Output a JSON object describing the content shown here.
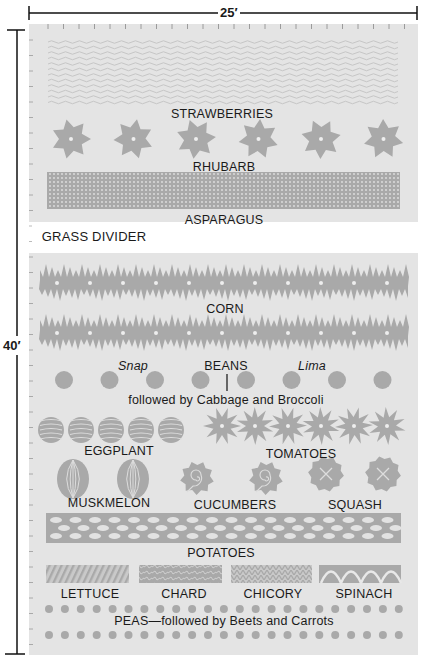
{
  "dimensions": {
    "width_label": "25′",
    "length_label": "40′"
  },
  "colors": {
    "bed": "#e4e4e4",
    "plant": "#a9a9a9",
    "pattern_light": "#c9c9c9",
    "text": "#1a1a1a"
  },
  "beds": [
    {
      "name": "upper-bed",
      "rows": [
        "strawberries",
        "rhubarb",
        "asparagus"
      ]
    },
    {
      "name": "lower-bed",
      "rows": [
        "corn",
        "beans",
        "eggplant",
        "tomatoes",
        "muskmelon",
        "cucumbers",
        "squash",
        "potatoes",
        "lettuce",
        "chard",
        "chicory",
        "spinach",
        "peas"
      ]
    }
  ],
  "labels": {
    "strawberries": "STRAWBERRIES",
    "rhubarb": "RHUBARB",
    "asparagus": "ASPARAGUS",
    "grass_divider": "GRASS DIVIDER",
    "corn": "CORN",
    "snap": "Snap",
    "beans": "BEANS",
    "lima": "Lima",
    "beans_followup": "followed by Cabbage and Broccoli",
    "eggplant": "EGGPLANT",
    "tomatoes": "TOMATOES",
    "muskmelon": "MUSKMELON",
    "cucumbers": "CUCUMBERS",
    "squash": "SQUASH",
    "potatoes": "POTATOES",
    "lettuce": "LETTUCE",
    "chard": "CHARD",
    "chicory": "CHICORY",
    "spinach": "SPINACH",
    "peas": "PEAS—followed by Beets and Carrots"
  },
  "plant_counts": {
    "rhubarb": 6,
    "corn_per_row": 11,
    "beans": 8,
    "eggplant": 5,
    "tomatoes": 6,
    "muskmelon": 2,
    "cucumbers": 2,
    "squash": 2,
    "peas_per_row": 23
  }
}
